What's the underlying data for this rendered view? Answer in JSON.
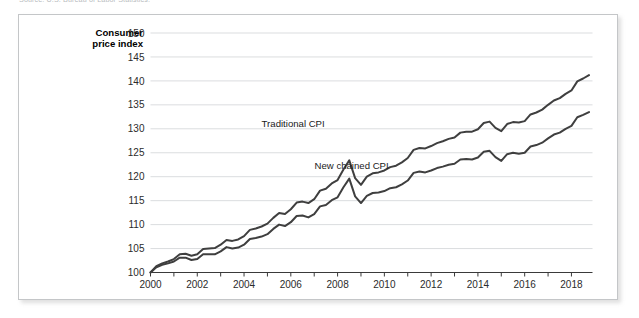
{
  "source_note": "Source: U.S. Bureau of Labor Statistics.",
  "axis_titles": {
    "y_line1": "Consumer",
    "y_line2": "price index"
  },
  "series_labels": {
    "traditional": "Traditional CPI",
    "chained": "New chained CPI"
  },
  "colors": {
    "line": "#3f3f3f",
    "grid": "#d7d9db",
    "axis": "#3a3a3a",
    "panel_border": "#c4c6c8",
    "background": "#ffffff"
  },
  "chart_data": {
    "type": "line",
    "title": "",
    "subtitle": "",
    "xlabel": "",
    "ylabel": "Consumer price index",
    "xlim": [
      2000,
      2018.9
    ],
    "ylim": [
      100,
      150
    ],
    "yticks": [
      100,
      105,
      110,
      115,
      120,
      125,
      130,
      135,
      140,
      145,
      150
    ],
    "xticks": [
      2000,
      2001,
      2002,
      2003,
      2004,
      2005,
      2006,
      2007,
      2008,
      2009,
      2010,
      2011,
      2012,
      2013,
      2014,
      2015,
      2016,
      2017,
      2018
    ],
    "xtick_labels": [
      "2000",
      "",
      "2002",
      "",
      "2004",
      "",
      "2006",
      "",
      "2008",
      "",
      "2010",
      "",
      "2012",
      "",
      "2014",
      "",
      "2016",
      "",
      "2018"
    ],
    "grid": "horizontal",
    "legend": "inline-annotations",
    "annotations": [
      {
        "text": "Traditional CPI",
        "x": 2006.1,
        "y": 130.4
      },
      {
        "text": "New chained CPI",
        "x": 2008.6,
        "y": 121.6
      }
    ],
    "series": [
      {
        "name": "Traditional CPI",
        "x": [
          2000.0,
          2000.25,
          2000.5,
          2000.75,
          2001.0,
          2001.25,
          2001.5,
          2001.75,
          2002.0,
          2002.25,
          2002.5,
          2002.75,
          2003.0,
          2003.25,
          2003.5,
          2003.75,
          2004.0,
          2004.25,
          2004.5,
          2004.75,
          2005.0,
          2005.25,
          2005.5,
          2005.75,
          2006.0,
          2006.25,
          2006.5,
          2006.75,
          2007.0,
          2007.25,
          2007.5,
          2007.75,
          2008.0,
          2008.25,
          2008.5,
          2008.75,
          2009.0,
          2009.25,
          2009.5,
          2009.75,
          2010.0,
          2010.25,
          2010.5,
          2010.75,
          2011.0,
          2011.25,
          2011.5,
          2011.75,
          2012.0,
          2012.25,
          2012.5,
          2012.75,
          2013.0,
          2013.25,
          2013.5,
          2013.75,
          2014.0,
          2014.25,
          2014.5,
          2014.75,
          2015.0,
          2015.25,
          2015.5,
          2015.75,
          2016.0,
          2016.25,
          2016.5,
          2016.75,
          2017.0,
          2017.25,
          2017.5,
          2017.75,
          2018.0,
          2018.25,
          2018.5,
          2018.75
        ],
        "values": [
          100.0,
          101.3,
          101.9,
          102.3,
          102.8,
          103.8,
          103.9,
          103.5,
          103.8,
          104.9,
          105.0,
          105.1,
          105.8,
          106.8,
          106.6,
          106.9,
          107.6,
          108.9,
          109.2,
          109.6,
          110.2,
          111.4,
          112.4,
          112.2,
          113.2,
          114.6,
          114.8,
          114.5,
          115.3,
          117.1,
          117.5,
          118.6,
          119.3,
          121.5,
          123.4,
          119.7,
          118.3,
          120.0,
          120.7,
          120.9,
          121.3,
          122.0,
          122.3,
          123.0,
          123.9,
          125.6,
          126.0,
          125.9,
          126.4,
          127.0,
          127.4,
          127.9,
          128.2,
          129.2,
          129.4,
          129.4,
          129.9,
          131.2,
          131.5,
          130.2,
          129.5,
          131.0,
          131.4,
          131.3,
          131.6,
          133.0,
          133.4,
          134.0,
          135.0,
          135.9,
          136.4,
          137.3,
          138.0,
          139.9,
          140.5,
          141.2
        ]
      },
      {
        "name": "New chained CPI",
        "x": [
          2000.0,
          2000.25,
          2000.5,
          2000.75,
          2001.0,
          2001.25,
          2001.5,
          2001.75,
          2002.0,
          2002.25,
          2002.5,
          2002.75,
          2003.0,
          2003.25,
          2003.5,
          2003.75,
          2004.0,
          2004.25,
          2004.5,
          2004.75,
          2005.0,
          2005.25,
          2005.5,
          2005.75,
          2006.0,
          2006.25,
          2006.5,
          2006.75,
          2007.0,
          2007.25,
          2007.5,
          2007.75,
          2008.0,
          2008.25,
          2008.5,
          2008.75,
          2009.0,
          2009.25,
          2009.5,
          2009.75,
          2010.0,
          2010.25,
          2010.5,
          2010.75,
          2011.0,
          2011.25,
          2011.5,
          2011.75,
          2012.0,
          2012.25,
          2012.5,
          2012.75,
          2013.0,
          2013.25,
          2013.5,
          2013.75,
          2014.0,
          2014.25,
          2014.5,
          2014.75,
          2015.0,
          2015.25,
          2015.5,
          2015.75,
          2016.0,
          2016.25,
          2016.5,
          2016.75,
          2017.0,
          2017.25,
          2017.5,
          2017.75,
          2018.0,
          2018.25,
          2018.5,
          2018.75
        ],
        "values": [
          100.0,
          101.1,
          101.6,
          101.9,
          102.3,
          103.1,
          103.1,
          102.6,
          102.8,
          103.8,
          103.8,
          103.8,
          104.4,
          105.3,
          105.0,
          105.2,
          105.8,
          107.0,
          107.2,
          107.5,
          108.0,
          109.1,
          110.0,
          109.7,
          110.5,
          111.8,
          111.9,
          111.5,
          112.2,
          113.8,
          114.1,
          115.1,
          115.7,
          117.8,
          119.6,
          115.9,
          114.5,
          116.0,
          116.6,
          116.7,
          117.0,
          117.6,
          117.8,
          118.4,
          119.2,
          120.8,
          121.1,
          120.9,
          121.3,
          121.8,
          122.1,
          122.5,
          122.7,
          123.6,
          123.7,
          123.6,
          124.0,
          125.2,
          125.4,
          124.1,
          123.3,
          124.7,
          125.0,
          124.8,
          125.0,
          126.3,
          126.6,
          127.1,
          128.0,
          128.8,
          129.2,
          130.0,
          130.6,
          132.4,
          132.9,
          133.5
        ]
      }
    ]
  }
}
